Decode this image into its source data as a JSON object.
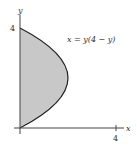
{
  "diagram": {
    "type": "shaded-region-plot",
    "equation": "x = y(4 − y)",
    "axes": {
      "x_label": "x",
      "y_label": "y",
      "x_tick": "4",
      "y_tick": "4"
    },
    "region": {
      "description": "Region bounded by the y-axis and the parabola x = y(4 − y) for 0 ≤ y ≤ 4",
      "fill_color": "#c8c8c8",
      "curve_color": "#222222"
    }
  }
}
